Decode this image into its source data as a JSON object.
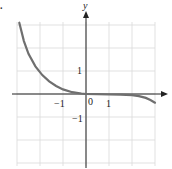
{
  "figure": {
    "corner_label": ".",
    "axis_x_label": "",
    "axis_y_label": "y",
    "tick_x_neg1": "−1",
    "tick_x_0": "0",
    "tick_x_1": "1",
    "tick_y_1": "1",
    "tick_y_neg1": "−1",
    "curve_color": "#6f6f6f",
    "grid_color": "#d9d9d9",
    "axis_color": "#222222"
  },
  "chart_data": {
    "type": "line",
    "title": "",
    "xlabel": "",
    "ylabel": "y",
    "xlim": [
      -3.2,
      3.6
    ],
    "ylim": [
      -3,
      3
    ],
    "grid": true,
    "x_ticks_labeled": [
      -1,
      0,
      1
    ],
    "y_ticks_labeled": [
      -1,
      1
    ],
    "series": [
      {
        "name": "curve",
        "x": [
          -2.9,
          -2.7,
          -2.5,
          -2.2,
          -1.9,
          -1.6,
          -1.3,
          -1.0,
          -0.6,
          -0.2,
          0.0,
          0.5,
          1.0,
          1.5,
          2.0,
          2.3,
          2.6,
          2.8,
          3.0
        ],
        "y": [
          3.1,
          2.3,
          1.75,
          1.2,
          0.82,
          0.55,
          0.35,
          0.2,
          0.08,
          0.02,
          0.0,
          -0.01,
          -0.02,
          -0.03,
          -0.05,
          -0.09,
          -0.17,
          -0.26,
          -0.38
        ]
      }
    ]
  }
}
